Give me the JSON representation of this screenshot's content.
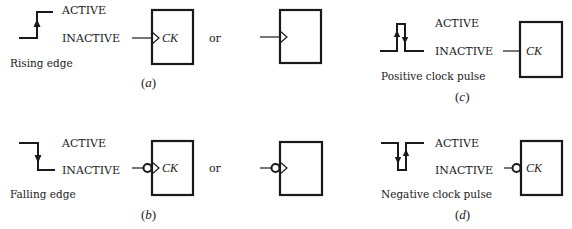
{
  "figure": {
    "colors": {
      "ink": "#1a1a1a",
      "background": "#ffffff"
    },
    "panels": [
      {
        "id": "a",
        "caption": "Rising edge",
        "sublabel": "a",
        "waveform": "rising-edge",
        "level_labels": {
          "high": "ACTIVE",
          "low": "INACTIVE"
        },
        "symbols": [
          {
            "clock_input": "dynamic-indicator",
            "inverted": false,
            "pin_label": "CK"
          },
          {
            "clock_input": "dynamic-indicator",
            "inverted": false,
            "pin_label": ""
          }
        ],
        "separator": "or"
      },
      {
        "id": "b",
        "caption": "Falling edge",
        "sublabel": "b",
        "waveform": "falling-edge",
        "level_labels": {
          "high": "ACTIVE",
          "low": "INACTIVE"
        },
        "symbols": [
          {
            "clock_input": "dynamic-indicator",
            "inverted": true,
            "pin_label": "CK"
          },
          {
            "clock_input": "dynamic-indicator",
            "inverted": true,
            "pin_label": ""
          }
        ],
        "separator": "or"
      },
      {
        "id": "c",
        "caption": "Positive clock pulse",
        "sublabel": "c",
        "waveform": "positive-pulse",
        "level_labels": {
          "high": "ACTIVE",
          "low": "INACTIVE"
        },
        "symbols": [
          {
            "clock_input": "level",
            "inverted": false,
            "pin_label": "CK"
          }
        ]
      },
      {
        "id": "d",
        "caption": "Negative clock pulse",
        "sublabel": "d",
        "waveform": "negative-pulse",
        "level_labels": {
          "high": "ACTIVE",
          "low": "INACTIVE"
        },
        "symbols": [
          {
            "clock_input": "level",
            "inverted": true,
            "pin_label": "CK"
          }
        ]
      }
    ]
  }
}
